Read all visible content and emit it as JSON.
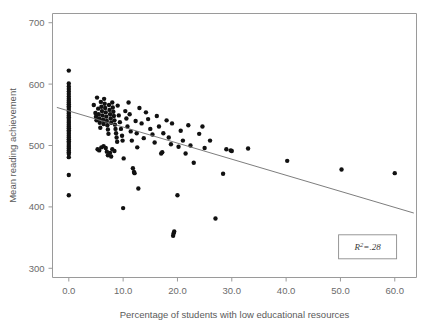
{
  "chart_data": {
    "type": "scatter",
    "title": "",
    "xlabel": "Percentage of students with low educational resources",
    "ylabel": "Mean reading achievement",
    "xlim": [
      -3.0,
      64.0
    ],
    "ylim": [
      285,
      715
    ],
    "xticks": [
      0.0,
      10.0,
      20.0,
      30.0,
      40.0,
      50.0,
      60.0
    ],
    "xtick_labels": [
      "0.0",
      "10.0",
      "20.0",
      "30.0",
      "40.0",
      "50.0",
      "60.0"
    ],
    "yticks": [
      300,
      400,
      500,
      600,
      700
    ],
    "ytick_labels": [
      "300",
      "400",
      "500",
      "600",
      "700"
    ],
    "grid": false,
    "legend": null,
    "annotations": [
      {
        "name": "r-squared-box",
        "text": "R2=.28",
        "symbol": "R",
        "superscript": "2",
        "value": "=.28",
        "x": 55.0,
        "y": 335
      }
    ],
    "trendline": {
      "name": "ols-regression-line",
      "x_start": -2.2,
      "y_start": 562,
      "x_end": 63.5,
      "y_end": 390,
      "slope": -2.62,
      "intercept": 556.2
    },
    "marker": {
      "shape": "circle",
      "size": 2.2,
      "color": "#111111"
    },
    "points": [
      [
        0.0,
        622
      ],
      [
        0.0,
        601
      ],
      [
        0.0,
        596
      ],
      [
        0.0,
        592
      ],
      [
        0.0,
        588
      ],
      [
        0.0,
        584
      ],
      [
        0.0,
        580
      ],
      [
        0.0,
        576
      ],
      [
        0.0,
        573
      ],
      [
        0.0,
        570
      ],
      [
        0.0,
        567
      ],
      [
        0.0,
        564
      ],
      [
        0.0,
        561
      ],
      [
        0.0,
        558
      ],
      [
        0.0,
        555
      ],
      [
        0.0,
        552
      ],
      [
        0.0,
        549
      ],
      [
        0.0,
        546
      ],
      [
        0.0,
        543
      ],
      [
        0.0,
        540
      ],
      [
        0.0,
        537
      ],
      [
        0.0,
        534
      ],
      [
        0.0,
        531
      ],
      [
        0.0,
        528
      ],
      [
        0.0,
        525
      ],
      [
        0.0,
        522
      ],
      [
        0.0,
        519
      ],
      [
        0.0,
        516
      ],
      [
        0.0,
        513
      ],
      [
        0.0,
        510
      ],
      [
        0.0,
        507
      ],
      [
        0.0,
        504
      ],
      [
        0.0,
        501
      ],
      [
        0.0,
        498
      ],
      [
        0.0,
        495
      ],
      [
        0.0,
        492
      ],
      [
        0.0,
        489
      ],
      [
        0.0,
        486
      ],
      [
        0.0,
        481
      ],
      [
        0.0,
        452
      ],
      [
        0.0,
        419
      ],
      [
        4.6,
        566
      ],
      [
        4.9,
        553
      ],
      [
        5.0,
        547
      ],
      [
        5.1,
        541
      ],
      [
        5.2,
        578
      ],
      [
        5.4,
        560
      ],
      [
        5.5,
        551
      ],
      [
        5.6,
        544
      ],
      [
        5.7,
        537
      ],
      [
        5.8,
        529
      ],
      [
        5.9,
        571
      ],
      [
        6.0,
        563
      ],
      [
        6.1,
        556
      ],
      [
        6.2,
        549
      ],
      [
        6.3,
        542
      ],
      [
        6.4,
        535
      ],
      [
        6.5,
        576
      ],
      [
        6.6,
        568
      ],
      [
        6.7,
        561
      ],
      [
        6.8,
        554
      ],
      [
        6.9,
        547
      ],
      [
        7.0,
        540
      ],
      [
        7.1,
        533
      ],
      [
        7.2,
        526
      ],
      [
        7.3,
        519
      ],
      [
        7.4,
        566
      ],
      [
        7.5,
        558
      ],
      [
        7.6,
        551
      ],
      [
        7.7,
        544
      ],
      [
        7.8,
        537
      ],
      [
        8.0,
        570
      ],
      [
        8.1,
        562
      ],
      [
        8.2,
        555
      ],
      [
        8.3,
        548
      ],
      [
        8.4,
        541
      ],
      [
        8.5,
        534
      ],
      [
        8.6,
        527
      ],
      [
        8.7,
        520
      ],
      [
        8.8,
        513
      ],
      [
        8.9,
        506
      ],
      [
        5.3,
        494
      ],
      [
        5.6,
        492
      ],
      [
        6.0,
        497
      ],
      [
        6.4,
        499
      ],
      [
        6.8,
        496
      ],
      [
        7.0,
        490
      ],
      [
        7.6,
        488
      ],
      [
        8.0,
        494
      ],
      [
        8.4,
        491
      ],
      [
        7.2,
        484
      ],
      [
        7.8,
        482
      ],
      [
        9.0,
        565
      ],
      [
        9.2,
        549
      ],
      [
        9.4,
        538
      ],
      [
        9.6,
        527
      ],
      [
        9.8,
        516
      ],
      [
        9.9,
        508
      ],
      [
        10.0,
        398
      ],
      [
        10.1,
        479
      ],
      [
        10.4,
        556
      ],
      [
        10.6,
        544
      ],
      [
        10.8,
        531
      ],
      [
        11.0,
        570
      ],
      [
        11.2,
        551
      ],
      [
        11.4,
        523
      ],
      [
        11.6,
        508
      ],
      [
        11.8,
        463
      ],
      [
        12.0,
        457
      ],
      [
        12.1,
        455
      ],
      [
        12.3,
        540
      ],
      [
        12.5,
        520
      ],
      [
        12.6,
        497
      ],
      [
        12.8,
        430
      ],
      [
        13.0,
        561
      ],
      [
        13.4,
        536
      ],
      [
        13.8,
        512
      ],
      [
        14.2,
        554
      ],
      [
        14.6,
        543
      ],
      [
        15.0,
        527
      ],
      [
        15.4,
        518
      ],
      [
        15.8,
        505
      ],
      [
        16.2,
        548
      ],
      [
        16.6,
        531
      ],
      [
        17.0,
        487
      ],
      [
        17.2,
        489
      ],
      [
        17.4,
        520
      ],
      [
        18.0,
        541
      ],
      [
        18.4,
        513
      ],
      [
        18.8,
        502
      ],
      [
        19.0,
        536
      ],
      [
        19.2,
        353
      ],
      [
        19.3,
        357
      ],
      [
        19.4,
        360
      ],
      [
        20.0,
        419
      ],
      [
        20.2,
        498
      ],
      [
        20.6,
        524
      ],
      [
        21.0,
        508
      ],
      [
        21.5,
        487
      ],
      [
        22.0,
        533
      ],
      [
        22.4,
        500
      ],
      [
        23.0,
        472
      ],
      [
        24.0,
        519
      ],
      [
        24.6,
        531
      ],
      [
        25.0,
        496
      ],
      [
        26.0,
        508
      ],
      [
        27.0,
        381
      ],
      [
        28.4,
        454
      ],
      [
        29.0,
        494
      ],
      [
        29.8,
        492
      ],
      [
        30.0,
        491
      ],
      [
        33.0,
        495
      ],
      [
        40.2,
        475
      ],
      [
        50.2,
        461
      ],
      [
        60.0,
        455
      ]
    ]
  }
}
